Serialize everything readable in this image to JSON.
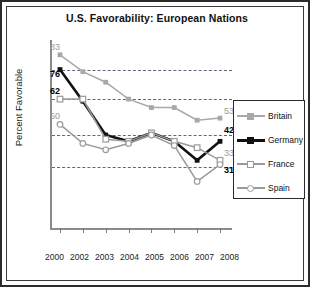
{
  "chart_data": {
    "type": "line",
    "title": "U.S. Favorability: European Nations",
    "xlabel": "",
    "ylabel": "Percent Favorable",
    "x": [
      "2000",
      "2002",
      "2003",
      "2004",
      "2005",
      "2006",
      "2007",
      "2008"
    ],
    "ylim": [
      0,
      90
    ],
    "grid": true,
    "gridlines": [
      76,
      62,
      45,
      30
    ],
    "legend_position": "right",
    "series": [
      {
        "name": "Britain",
        "color": "#a8a8a8",
        "marker": "filled-square",
        "values": [
          83,
          75,
          70,
          62,
          58,
          58,
          52,
          53
        ],
        "start_label": "83",
        "end_label": "53"
      },
      {
        "name": "Germany",
        "color": "#111111",
        "marker": "filled-square",
        "values": [
          76,
          61,
          45,
          42,
          46,
          42,
          33,
          42
        ],
        "start_label": "76",
        "end_label": "42"
      },
      {
        "name": "France",
        "color": "#9a9a9a",
        "marker": "open-square",
        "values": [
          62,
          62,
          43,
          42,
          46,
          42,
          39,
          33
        ],
        "start_label": "62",
        "end_label": "33"
      },
      {
        "name": "Spain",
        "color": "#9a9a9a",
        "marker": "open-circle",
        "values": [
          50,
          41,
          38,
          41,
          45,
          40,
          23,
          31
        ],
        "start_label": "50",
        "end_label": "31"
      }
    ]
  },
  "legend": {
    "items": [
      {
        "label": "Britain"
      },
      {
        "label": "Germany"
      },
      {
        "label": "France"
      },
      {
        "label": "Spain"
      }
    ]
  }
}
